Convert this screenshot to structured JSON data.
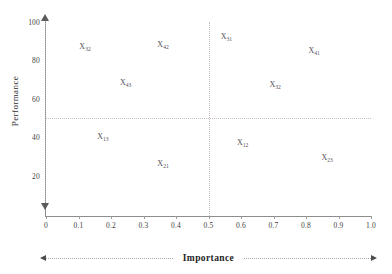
{
  "chart_data": {
    "type": "scatter",
    "title": "",
    "xlabel": "Importance",
    "ylabel": "Performance",
    "xlim": [
      0,
      1.0
    ],
    "ylim": [
      0,
      100
    ],
    "grid": false,
    "legend": "none",
    "xticks": [
      "0",
      "0.1",
      "0.2",
      "0.3",
      "0.4",
      "0.5",
      "0.6",
      "0.7",
      "0.8",
      "0.9",
      "1.0"
    ],
    "xtick_values": [
      0,
      0.1,
      0.2,
      0.3,
      0.4,
      0.5,
      0.6,
      0.7,
      0.8,
      0.9,
      1.0
    ],
    "yticks": [
      "20",
      "40",
      "60",
      "80",
      "100"
    ],
    "ytick_values": [
      20,
      40,
      60,
      80,
      100
    ],
    "quadrant_dividers": {
      "x": 0.5,
      "y": 50
    },
    "point_label_base": "X",
    "points": [
      {
        "label": "X",
        "sub": "32",
        "x": 0.12,
        "y": 87
      },
      {
        "label": "X",
        "sub": "42",
        "x": 0.36,
        "y": 88
      },
      {
        "label": "X",
        "sub": "31",
        "x": 0.555,
        "y": 92
      },
      {
        "label": "X",
        "sub": "41",
        "x": 0.825,
        "y": 85
      },
      {
        "label": "X",
        "sub": "43",
        "x": 0.245,
        "y": 68
      },
      {
        "label": "X",
        "sub": "32",
        "x": 0.705,
        "y": 67
      },
      {
        "label": "X",
        "sub": "13",
        "x": 0.175,
        "y": 40
      },
      {
        "label": "X",
        "sub": "12",
        "x": 0.605,
        "y": 37
      },
      {
        "label": "X",
        "sub": "21",
        "x": 0.36,
        "y": 26
      },
      {
        "label": "X",
        "sub": "23",
        "x": 0.865,
        "y": 29
      }
    ]
  },
  "axes": {
    "y_title": "Performance",
    "x_title": "Importance"
  }
}
